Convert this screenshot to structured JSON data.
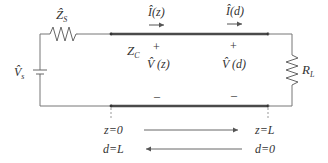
{
  "diagram": {
    "type": "transmission-line-circuit",
    "source": {
      "voltage_label": "V̂",
      "voltage_sub": "s",
      "impedance_label": "Ẑ",
      "impedance_sub": "S"
    },
    "line": {
      "impedance_label": "Z",
      "impedance_sub": "C",
      "current_z_label": "Î(z)",
      "current_d_label": "Î(d)",
      "voltage_z_label": "V̂ (z)",
      "voltage_d_label": "V̂ (d)",
      "plus": "+",
      "minus": "–"
    },
    "load": {
      "label": "R",
      "sub": "L"
    },
    "axis": {
      "z_start": "z=0",
      "z_end": "z=L",
      "d_start": "d=L",
      "d_end": "d=0"
    },
    "colors": {
      "wire": "#666666",
      "line": "#444444",
      "text": "#333333"
    }
  }
}
